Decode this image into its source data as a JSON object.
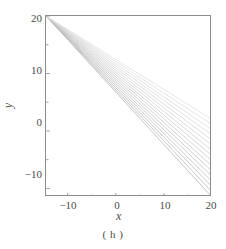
{
  "figure": {
    "caption": "( h )",
    "background_color": "#ffffff",
    "frame_color": "#8d8d8d",
    "line_color": "#c9c9c9"
  },
  "chart_data": {
    "type": "line",
    "title": "",
    "subtitle": "",
    "xlabel": "x",
    "ylabel": "y",
    "xlim": [
      -14.5,
      20.0
    ],
    "ylim": [
      -11.5,
      20.0
    ],
    "xticks": [
      -10,
      0,
      10,
      20
    ],
    "xtick_labels": [
      "−10",
      "0",
      "10",
      "20"
    ],
    "yticks": [
      -10,
      0,
      10,
      20
    ],
    "ytick_labels": [
      "−10",
      "0",
      "10",
      "20"
    ],
    "minor_ticks": true,
    "grid": false,
    "legend": null,
    "annotations": [],
    "series": [
      {
        "name": "line-1",
        "x": [
          -14.5,
          20.0
        ],
        "y": [
          20.0,
          -11.5
        ]
      },
      {
        "name": "line-2",
        "x": [
          -14.5,
          20.0
        ],
        "y": [
          20.0,
          -10.6
        ]
      },
      {
        "name": "line-3",
        "x": [
          -14.5,
          20.0
        ],
        "y": [
          20.0,
          -9.7
        ]
      },
      {
        "name": "line-4",
        "x": [
          -14.5,
          20.0
        ],
        "y": [
          20.0,
          -8.8
        ]
      },
      {
        "name": "line-5",
        "x": [
          -14.5,
          20.0
        ],
        "y": [
          20.0,
          -7.9
        ]
      },
      {
        "name": "line-6",
        "x": [
          -14.5,
          20.0
        ],
        "y": [
          20.0,
          -7.0
        ]
      },
      {
        "name": "line-7",
        "x": [
          -14.5,
          20.0
        ],
        "y": [
          20.0,
          -6.1
        ]
      },
      {
        "name": "line-8",
        "x": [
          -14.5,
          20.0
        ],
        "y": [
          20.0,
          -5.2
        ]
      },
      {
        "name": "line-9",
        "x": [
          -14.5,
          20.0
        ],
        "y": [
          20.0,
          -4.3
        ]
      },
      {
        "name": "line-10",
        "x": [
          -14.5,
          20.0
        ],
        "y": [
          20.0,
          -3.4
        ]
      },
      {
        "name": "line-11",
        "x": [
          -14.5,
          20.0
        ],
        "y": [
          20.0,
          -2.5
        ]
      },
      {
        "name": "line-12",
        "x": [
          -14.5,
          20.0
        ],
        "y": [
          20.0,
          -1.6
        ]
      },
      {
        "name": "line-13",
        "x": [
          -14.5,
          20.0
        ],
        "y": [
          20.0,
          -0.7
        ]
      },
      {
        "name": "line-14",
        "x": [
          -14.5,
          20.0
        ],
        "y": [
          20.0,
          0.2
        ]
      },
      {
        "name": "line-15",
        "x": [
          -14.5,
          20.0
        ],
        "y": [
          20.0,
          1.1
        ]
      },
      {
        "name": "line-16",
        "x": [
          -14.5,
          20.0
        ],
        "y": [
          20.0,
          2.0
        ]
      }
    ]
  }
}
